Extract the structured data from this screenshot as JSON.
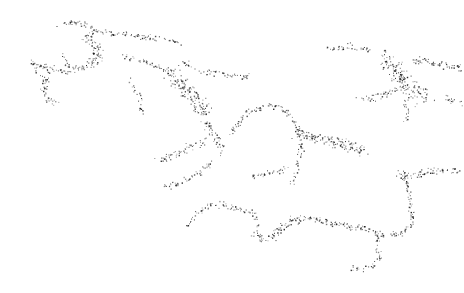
{
  "image": {
    "width": 464,
    "height": 293,
    "background": "#ffffff",
    "dot_color": "#1a1a1a",
    "description": "stippled branching filament point cloud"
  },
  "clusters": [
    {
      "name": "top-left-arc",
      "path": [
        [
          58,
          26
        ],
        [
          72,
          22
        ],
        [
          84,
          24
        ],
        [
          96,
          30
        ],
        [
          112,
          33
        ],
        [
          130,
          34
        ],
        [
          148,
          37
        ],
        [
          166,
          40
        ],
        [
          178,
          42
        ]
      ],
      "spread": 3,
      "density": 7
    },
    {
      "name": "top-left-hub",
      "path": [
        [
          84,
          34
        ],
        [
          92,
          40
        ],
        [
          98,
          48
        ],
        [
          96,
          58
        ],
        [
          90,
          66
        ]
      ],
      "spread": 6,
      "density": 14
    },
    {
      "name": "left-arm",
      "path": [
        [
          32,
          64
        ],
        [
          44,
          66
        ],
        [
          56,
          70
        ],
        [
          68,
          70
        ],
        [
          80,
          66
        ],
        [
          92,
          64
        ]
      ],
      "spread": 4,
      "density": 8
    },
    {
      "name": "left-drop",
      "path": [
        [
          48,
          72
        ],
        [
          44,
          82
        ],
        [
          42,
          92
        ],
        [
          48,
          100
        ],
        [
          56,
          102
        ]
      ],
      "spread": 4,
      "density": 8
    },
    {
      "name": "upper-spur",
      "path": [
        [
          62,
          54
        ],
        [
          66,
          62
        ],
        [
          70,
          68
        ]
      ],
      "spread": 3,
      "density": 6
    },
    {
      "name": "mid-bridge",
      "path": [
        [
          120,
          56
        ],
        [
          134,
          58
        ],
        [
          146,
          62
        ],
        [
          160,
          68
        ],
        [
          172,
          72
        ]
      ],
      "spread": 3,
      "density": 6
    },
    {
      "name": "mid-drop",
      "path": [
        [
          130,
          80
        ],
        [
          138,
          92
        ],
        [
          140,
          104
        ],
        [
          144,
          114
        ]
      ],
      "spread": 3,
      "density": 5
    },
    {
      "name": "central-hub",
      "path": [
        [
          168,
          70
        ],
        [
          176,
          78
        ],
        [
          184,
          86
        ],
        [
          192,
          96
        ],
        [
          200,
          108
        ],
        [
          206,
          118
        ]
      ],
      "spread": 8,
      "density": 18
    },
    {
      "name": "central-arm-right",
      "path": [
        [
          196,
          70
        ],
        [
          212,
          72
        ],
        [
          228,
          74
        ],
        [
          244,
          76
        ],
        [
          254,
          74
        ]
      ],
      "spread": 3,
      "density": 6
    },
    {
      "name": "central-arm-up",
      "path": [
        [
          180,
          58
        ],
        [
          186,
          62
        ],
        [
          190,
          68
        ]
      ],
      "spread": 3,
      "density": 6
    },
    {
      "name": "central-tail",
      "path": [
        [
          204,
          120
        ],
        [
          212,
          130
        ],
        [
          218,
          142
        ],
        [
          222,
          150
        ]
      ],
      "spread": 5,
      "density": 10
    },
    {
      "name": "left-lower-arm",
      "path": [
        [
          156,
          160
        ],
        [
          166,
          158
        ],
        [
          176,
          154
        ],
        [
          186,
          148
        ],
        [
          196,
          144
        ],
        [
          206,
          140
        ]
      ],
      "spread": 4,
      "density": 8
    },
    {
      "name": "left-lower-tail",
      "path": [
        [
          162,
          186
        ],
        [
          174,
          184
        ],
        [
          186,
          180
        ],
        [
          196,
          174
        ],
        [
          204,
          168
        ],
        [
          212,
          160
        ]
      ],
      "spread": 3,
      "density": 7
    },
    {
      "name": "mid-loop",
      "path": [
        [
          230,
          134
        ],
        [
          238,
          122
        ],
        [
          246,
          114
        ],
        [
          256,
          110
        ],
        [
          268,
          104
        ],
        [
          280,
          108
        ],
        [
          292,
          118
        ],
        [
          298,
          130
        ]
      ],
      "spread": 3,
      "density": 7
    },
    {
      "name": "mid-right-hub",
      "path": [
        [
          296,
          132
        ],
        [
          310,
          136
        ],
        [
          324,
          138
        ],
        [
          338,
          142
        ],
        [
          352,
          146
        ],
        [
          364,
          150
        ]
      ],
      "spread": 6,
      "density": 16
    },
    {
      "name": "mid-right-up",
      "path": [
        [
          298,
          130
        ],
        [
          302,
          146
        ],
        [
          298,
          160
        ],
        [
          296,
          172
        ],
        [
          292,
          182
        ]
      ],
      "spread": 3,
      "density": 6
    },
    {
      "name": "small-branch",
      "path": [
        [
          250,
          178
        ],
        [
          260,
          174
        ],
        [
          270,
          172
        ],
        [
          280,
          170
        ],
        [
          288,
          166
        ]
      ],
      "spread": 3,
      "density": 6
    },
    {
      "name": "upper-right-line",
      "path": [
        [
          324,
          48
        ],
        [
          336,
          48
        ],
        [
          348,
          46
        ],
        [
          358,
          48
        ],
        [
          372,
          50
        ]
      ],
      "spread": 3,
      "density": 6
    },
    {
      "name": "right-hub",
      "path": [
        [
          382,
          56
        ],
        [
          392,
          66
        ],
        [
          400,
          76
        ],
        [
          408,
          84
        ],
        [
          416,
          92
        ],
        [
          426,
          98
        ]
      ],
      "spread": 9,
      "density": 20
    },
    {
      "name": "right-arm-top",
      "path": [
        [
          412,
          62
        ],
        [
          426,
          60
        ],
        [
          440,
          64
        ],
        [
          452,
          66
        ],
        [
          462,
          68
        ]
      ],
      "spread": 4,
      "density": 10
    },
    {
      "name": "right-arm-mid",
      "path": [
        [
          360,
          100
        ],
        [
          376,
          96
        ],
        [
          392,
          92
        ],
        [
          404,
          88
        ]
      ],
      "spread": 4,
      "density": 8
    },
    {
      "name": "right-drop",
      "path": [
        [
          404,
          100
        ],
        [
          410,
          112
        ],
        [
          404,
          122
        ]
      ],
      "spread": 3,
      "density": 6
    },
    {
      "name": "right-far",
      "path": [
        [
          440,
          96
        ],
        [
          452,
          100
        ],
        [
          462,
          104
        ]
      ],
      "spread": 3,
      "density": 6
    },
    {
      "name": "bottom-left-arc",
      "path": [
        [
          186,
          226
        ],
        [
          194,
          216
        ],
        [
          204,
          208
        ],
        [
          214,
          204
        ],
        [
          228,
          206
        ],
        [
          242,
          210
        ],
        [
          254,
          214
        ],
        [
          258,
          224
        ]
      ],
      "spread": 3,
      "density": 7
    },
    {
      "name": "bottom-valley",
      "path": [
        [
          252,
          230
        ],
        [
          262,
          238
        ],
        [
          272,
          236
        ],
        [
          282,
          226
        ],
        [
          292,
          220
        ],
        [
          306,
          218
        ]
      ],
      "spread": 4,
      "density": 10
    },
    {
      "name": "bottom-wave",
      "path": [
        [
          306,
          218
        ],
        [
          320,
          220
        ],
        [
          334,
          224
        ],
        [
          348,
          226
        ],
        [
          362,
          228
        ],
        [
          376,
          232
        ],
        [
          384,
          236
        ]
      ],
      "spread": 3,
      "density": 9
    },
    {
      "name": "bottom-drop",
      "path": [
        [
          376,
          236
        ],
        [
          378,
          248
        ],
        [
          380,
          258
        ],
        [
          374,
          266
        ],
        [
          362,
          268
        ],
        [
          350,
          268
        ]
      ],
      "spread": 3,
      "density": 6
    },
    {
      "name": "right-vertical",
      "path": [
        [
          402,
          168
        ],
        [
          406,
          180
        ],
        [
          408,
          192
        ],
        [
          410,
          204
        ],
        [
          412,
          216
        ],
        [
          410,
          226
        ],
        [
          402,
          232
        ],
        [
          390,
          234
        ]
      ],
      "spread": 3,
      "density": 8
    },
    {
      "name": "right-vertical-hub",
      "path": [
        [
          396,
          174
        ],
        [
          404,
          178
        ],
        [
          412,
          176
        ],
        [
          422,
          172
        ],
        [
          434,
          170
        ],
        [
          446,
          170
        ],
        [
          460,
          170
        ]
      ],
      "spread": 4,
      "density": 8
    },
    {
      "name": "far-left-dots",
      "path": [
        [
          32,
          60
        ],
        [
          36,
          68
        ],
        [
          40,
          76
        ]
      ],
      "spread": 3,
      "density": 4
    }
  ]
}
